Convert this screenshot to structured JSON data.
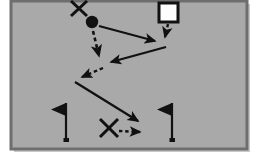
{
  "diagram": {
    "title": "Tactical play diagram",
    "type": "sports-play-diagram",
    "canvas": {
      "width": 257,
      "height": 160
    },
    "colors": {
      "page_background": "#ffffff",
      "field_fill": "#a9a9a9",
      "field_border_outer": "#8f8f8f",
      "field_border_inner": "#6e6e6e",
      "ink": "#111111",
      "marker_fill_white": "#fdfdfd",
      "shadow": "#bfbfbf"
    },
    "field": {
      "label": "playing-field",
      "x": 11,
      "y": 1,
      "width": 236,
      "height": 148,
      "border_width": 3
    },
    "markers": [
      {
        "id": "x-top",
        "kind": "x-marker",
        "label": "X",
        "cx": 79,
        "cy": 8,
        "size": 17,
        "stroke": 3
      },
      {
        "id": "ball-carrier",
        "kind": "filled-circle-marker",
        "label": "O",
        "cx": 92,
        "cy": 22,
        "radius": 6
      },
      {
        "id": "square-top-right",
        "kind": "square-marker",
        "label": "□",
        "x": 159,
        "y": 3,
        "size": 19,
        "stroke": 3,
        "fill": "#fdfdfd"
      },
      {
        "id": "x-bottom",
        "kind": "x-marker",
        "label": "X",
        "cx": 109,
        "cy": 128,
        "size": 18,
        "stroke": 3
      }
    ],
    "flags": [
      {
        "id": "flag-left",
        "label": "flag-marker-left",
        "pole_x": 66,
        "pole_top": 103,
        "pole_bottom": 141,
        "flag_width": 15,
        "flag_height": 12,
        "direction": "left"
      },
      {
        "id": "flag-right",
        "label": "flag-marker-right",
        "pole_x": 172,
        "pole_top": 103,
        "pole_bottom": 141,
        "flag_width": 15,
        "flag_height": 12,
        "direction": "left"
      }
    ],
    "routes": [
      {
        "id": "route-1",
        "label": "solid-route-circle-to-right",
        "style": "solid",
        "meaning": "player movement",
        "points": "98,26 160,42",
        "arrowhead": true
      },
      {
        "id": "route-2",
        "label": "dashed-route-square-down",
        "style": "dashed",
        "meaning": "pass",
        "points": "168,23 165,41",
        "arrowhead": true
      },
      {
        "id": "route-3",
        "label": "dashed-route-circle-down",
        "style": "dashed",
        "meaning": "pass",
        "points": "92,30 99,60",
        "arrowhead": true
      },
      {
        "id": "route-4",
        "label": "solid-route-right-to-left",
        "style": "solid",
        "meaning": "player movement",
        "points": "165,48 106,63",
        "arrowhead": true
      },
      {
        "id": "route-5",
        "label": "dashed-route-to-lower-left",
        "style": "dashed",
        "meaning": "pass",
        "points": "101,68 77,78",
        "arrowhead": true
      },
      {
        "id": "route-6",
        "label": "solid-route-left-to-bottom-right",
        "style": "solid",
        "meaning": "player movement",
        "points": "76,82 142,123",
        "arrowhead": true
      },
      {
        "id": "route-7",
        "label": "dashed-route-bottom-x-right",
        "style": "dashed",
        "meaning": "pass",
        "points": "119,131 145,132",
        "arrowhead": true
      }
    ]
  }
}
